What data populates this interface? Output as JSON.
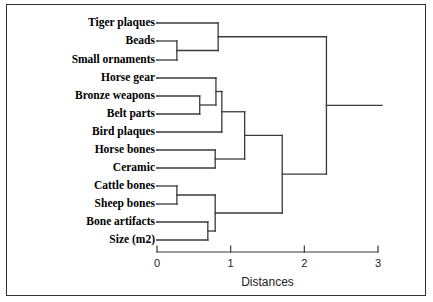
{
  "figure": {
    "kind": "dendrogram",
    "background_color": "#ffffff",
    "border_color": "#333333",
    "line_color": "#3a3a3a"
  },
  "axis": {
    "title": "Distances",
    "ticks": [
      "0",
      "1",
      "2",
      "3"
    ],
    "tick_values": [
      0,
      1,
      2,
      3
    ],
    "min": 0,
    "max": 3,
    "pixel_min": 157,
    "pixel_max": 378
  },
  "leaves": [
    {
      "label": "Tiger plaques",
      "y": 23
    },
    {
      "label": "Beads",
      "y": 41
    },
    {
      "label": "Small ornaments",
      "y": 60
    },
    {
      "label": "Horse gear",
      "y": 78
    },
    {
      "label": "Bronze weapons",
      "y": 96
    },
    {
      "label": "Belt parts",
      "y": 114
    },
    {
      "label": "Bird plaques",
      "y": 132
    },
    {
      "label": "Horse bones",
      "y": 150
    },
    {
      "label": "Ceramic",
      "y": 168
    },
    {
      "label": "Cattle bones",
      "y": 186
    },
    {
      "label": "Sheep bones",
      "y": 204
    },
    {
      "label": "Bone artifacts",
      "y": 222
    },
    {
      "label": "Size (m2)",
      "y": 240
    }
  ],
  "chart_data": {
    "type": "dendrogram",
    "title": "",
    "xlabel": "Distances",
    "ylabel": "",
    "xlim": [
      0,
      3
    ],
    "grid": false,
    "legend": null,
    "labels": [
      "Tiger plaques",
      "Beads",
      "Small ornaments",
      "Horse gear",
      "Bronze weapons",
      "Belt parts",
      "Bird plaques",
      "Horse bones",
      "Ceramic",
      "Cattle bones",
      "Sheep bones",
      "Bone artifacts",
      "Size (m2)"
    ],
    "merges": [
      {
        "id": "m1",
        "left": "Beads",
        "right": "Small ornaments",
        "distance": 0.27
      },
      {
        "id": "m2",
        "left": "Tiger plaques",
        "right": "m1",
        "distance": 0.83
      },
      {
        "id": "m3",
        "left": "Bronze weapons",
        "right": "Belt parts",
        "distance": 0.58
      },
      {
        "id": "m4",
        "left": "Horse gear",
        "right": "m3",
        "distance": 0.8
      },
      {
        "id": "m5",
        "left": "m4",
        "right": "Bird plaques",
        "distance": 0.88
      },
      {
        "id": "m6",
        "left": "Horse bones",
        "right": "Ceramic",
        "distance": 0.79
      },
      {
        "id": "m7",
        "left": "m5",
        "right": "m6",
        "distance": 1.19
      },
      {
        "id": "m8",
        "left": "Cattle bones",
        "right": "Sheep bones",
        "distance": 0.27
      },
      {
        "id": "m9",
        "left": "Bone artifacts",
        "right": "Size (m2)",
        "distance": 0.69
      },
      {
        "id": "m10",
        "left": "m8",
        "right": "m9",
        "distance": 0.79
      },
      {
        "id": "m11",
        "left": "m7",
        "right": "m10",
        "distance": 1.7
      },
      {
        "id": "m12",
        "left": "m2",
        "right": "m11",
        "distance": 2.3
      }
    ]
  }
}
